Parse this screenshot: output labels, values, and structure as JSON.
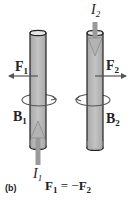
{
  "figure": {
    "panel_tag": "(b)",
    "equation": {
      "lhs": "F",
      "lhs_sub": "1",
      "op": " = −",
      "rhs": "F",
      "rhs_sub": "2"
    },
    "wires": [
      {
        "id": "wire-1",
        "current": {
          "symbol": "I",
          "sub": "1",
          "direction": "up"
        },
        "force": {
          "symbol": "F",
          "sub": "1",
          "direction": "left"
        },
        "field": {
          "symbol": "B",
          "sub": "1",
          "circulation": "counterclockwise-from-above"
        }
      },
      {
        "id": "wire-2",
        "current": {
          "symbol": "I",
          "sub": "2",
          "direction": "down"
        },
        "force": {
          "symbol": "F",
          "sub": "2",
          "direction": "right"
        },
        "field": {
          "symbol": "B",
          "sub": "2",
          "circulation": "clockwise-from-above"
        }
      }
    ],
    "colors": {
      "cylinder_fill": "#b9b9b9",
      "cylinder_edge": "#222222",
      "cylinder_top": "#e6e6e6",
      "arrow": "#555555",
      "current_arrow": "#9a9a9a",
      "text": "#222222"
    }
  }
}
